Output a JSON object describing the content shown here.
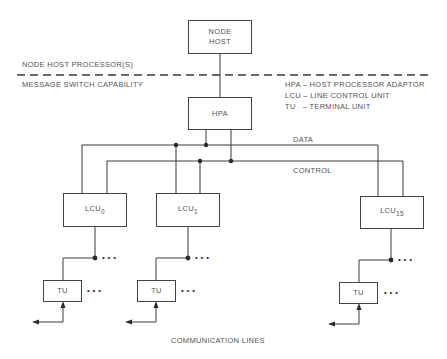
{
  "diagram": {
    "layers": {
      "upper": "NODE HOST PROCESSOR(S)",
      "lower": "MESSAGE SWITCH CAPABILITY"
    },
    "node_host": {
      "line1": "NODE",
      "line2": "HOST"
    },
    "hpa": {
      "label": "HPA"
    },
    "legend": [
      {
        "abbr": "HPA",
        "text": "HPA – HOST PROCESSOR ADAPTOR"
      },
      {
        "abbr": "LCU",
        "text": "LCU – LINE CONTROL UNIT"
      },
      {
        "abbr": "TU",
        "text": "TU   – TERMINAL UNIT"
      }
    ],
    "buses": {
      "data": "DATA",
      "control": "CONTROL"
    },
    "lcus": [
      {
        "base": "LCU",
        "sub": "0"
      },
      {
        "base": "LCU",
        "sub": "1"
      },
      {
        "base": "LCU",
        "sub": "15"
      }
    ],
    "tus": [
      {
        "label": "TU"
      },
      {
        "label": "TU"
      },
      {
        "label": "TU"
      }
    ],
    "ellipsis": "• • •",
    "footer": "COMMUNICATION LINES",
    "colors": {
      "line": "#3a3a3a",
      "text": "#555555"
    }
  }
}
